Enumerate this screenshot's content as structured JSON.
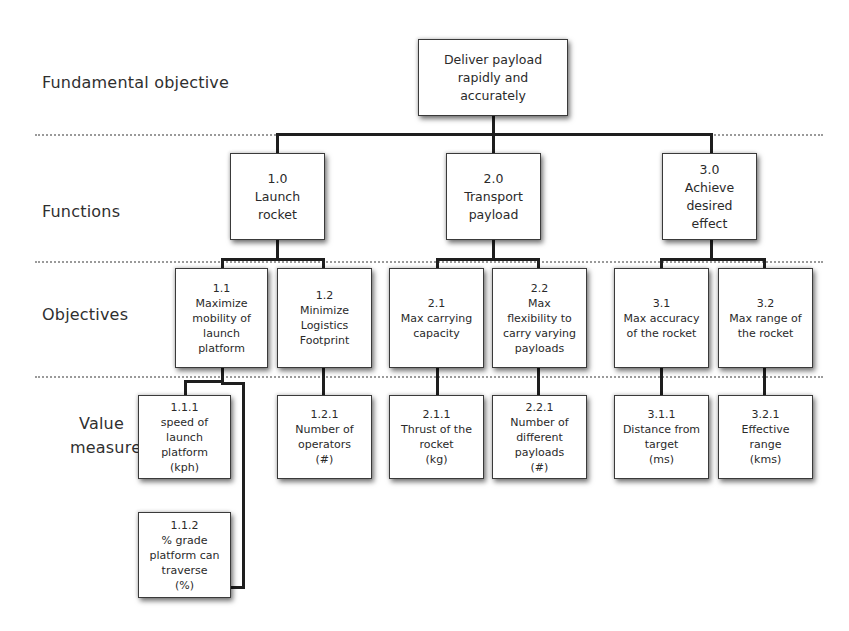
{
  "diagram": {
    "tiers": {
      "fundamental": "Fundamental objective",
      "functions": "Functions",
      "objectives": "Objectives",
      "value_measures_line1": "Value",
      "value_measures_line2": "measures"
    },
    "root": {
      "text": "Deliver payload\nrapidly and\naccurately"
    },
    "functions": [
      {
        "code": "1.0",
        "text": "Launch\nrocket"
      },
      {
        "code": "2.0",
        "text": "Transport\npayload"
      },
      {
        "code": "3.0",
        "text": "Achieve\ndesired\neffect"
      }
    ],
    "objectives": [
      {
        "code": "1.1",
        "text": "Maximize\nmobility of\nlaunch\nplatform"
      },
      {
        "code": "1.2",
        "text": "Minimize\nLogistics\nFootprint"
      },
      {
        "code": "2.1",
        "text": "Max  carrying\ncapacity"
      },
      {
        "code": "2.2",
        "text": "Max\nflexibility to\ncarry varying\npayloads"
      },
      {
        "code": "3.1",
        "text": "Max accuracy\nof the rocket"
      },
      {
        "code": "3.2",
        "text": "Max range of\nthe rocket"
      }
    ],
    "value_measures": [
      {
        "code": "1.1.1",
        "text": "speed of\nlaunch\nplatform\n(kph)"
      },
      {
        "code": "1.1.2",
        "text": "% grade\nplatform can\ntraverse\n(%)"
      },
      {
        "code": "1.2.1",
        "text": "Number of\noperators\n(#)"
      },
      {
        "code": "2.1.1",
        "text": "Thrust of the\nrocket\n(kg)"
      },
      {
        "code": "2.2.1",
        "text": "Number of\ndifferent\npayloads\n(#)"
      },
      {
        "code": "3.1.1",
        "text": "Distance from\ntarget\n(ms)"
      },
      {
        "code": "3.2.1",
        "text": "Effective\nrange\n(kms)"
      }
    ]
  }
}
